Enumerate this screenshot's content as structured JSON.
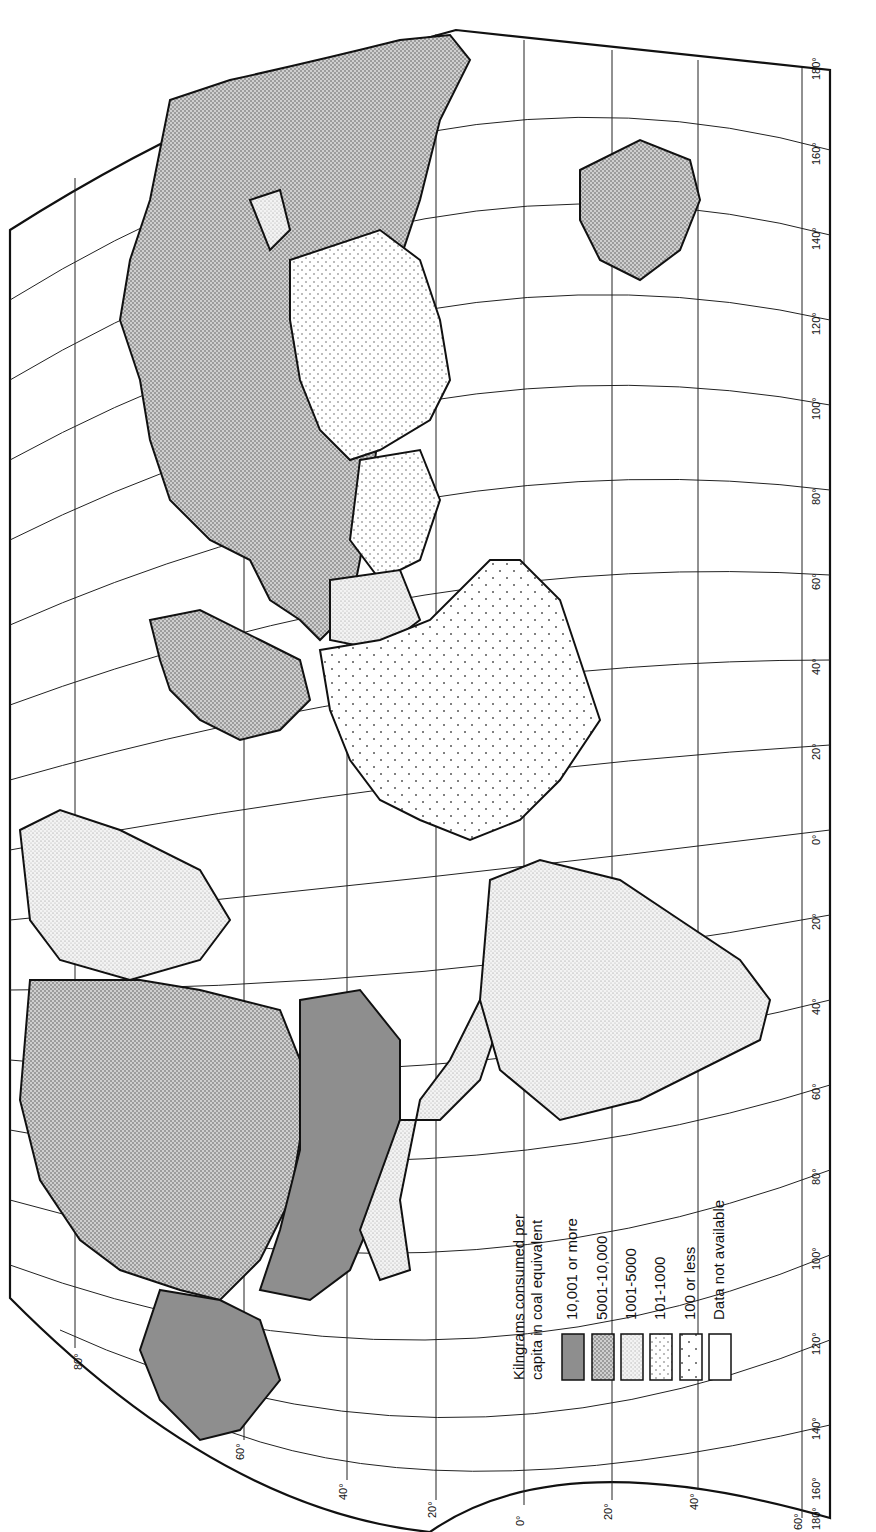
{
  "legend": {
    "title_line1": "Kilngrams consumed per",
    "title_line2": "capita in coal equivalent",
    "items": [
      {
        "label": "10,001 or more",
        "pattern": "solid-dark",
        "color": "#8e8e8e"
      },
      {
        "label": "5001-10,000",
        "pattern": "dense-stipple",
        "color": "#b4b4b4"
      },
      {
        "label": "1001-5000",
        "pattern": "fine-stipple",
        "color": "#e4e4e4"
      },
      {
        "label": "101-1000",
        "pattern": "medium-dots",
        "color": "#efefef"
      },
      {
        "label": "100 or less",
        "pattern": "sparse-dots",
        "color": "#f7f7f7"
      },
      {
        "label": "Data not available",
        "pattern": "blank",
        "color": "#ffffff"
      }
    ]
  },
  "axes": {
    "longitude_labels_right_side": [
      "180°",
      "160°",
      "140°",
      "120°",
      "100°",
      "80°",
      "60°",
      "40°",
      "20°",
      "0°",
      "20°",
      "40°",
      "60°",
      "80°",
      "100°",
      "120°",
      "140°",
      "160°",
      "180°"
    ],
    "latitude_labels_bottom": [
      "80°",
      "60°",
      "40°",
      "20°",
      "0°",
      "20°",
      "40°",
      "60°"
    ],
    "latitude_label_topleft": "80°"
  },
  "regions": [
    {
      "name": "USSR",
      "category": "5001-10,000"
    },
    {
      "name": "Canada",
      "category": "5001-10,000"
    },
    {
      "name": "United States",
      "category": "10,001 or more"
    },
    {
      "name": "Alaska",
      "category": "10,001 or more"
    },
    {
      "name": "Australia",
      "category": "5001-10,000"
    },
    {
      "name": "Europe (west)",
      "category": "5001-10,000"
    },
    {
      "name": "Scandinavia",
      "category": "5001-10,000"
    },
    {
      "name": "Greenland",
      "category": "1001-5000"
    },
    {
      "name": "China",
      "category": "101-1000"
    },
    {
      "name": "India",
      "category": "101-1000"
    },
    {
      "name": "Africa",
      "category": "100 or less"
    },
    {
      "name": "South America",
      "category": "1001-5000"
    },
    {
      "name": "Mexico",
      "category": "1001-5000"
    }
  ]
}
